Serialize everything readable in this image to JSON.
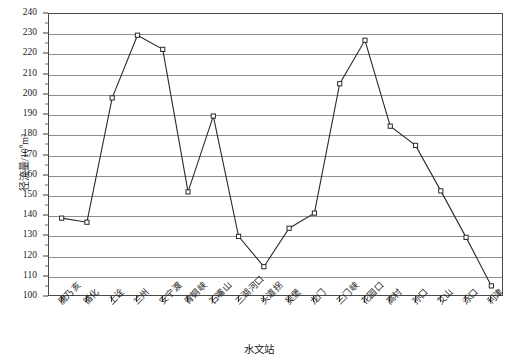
{
  "chart_data": {
    "type": "line",
    "title": "",
    "xlabel": "水文站",
    "ylabel": "径流量/10⁸m³",
    "ylabel_base": "径流量/10",
    "ylabel_sup": "8",
    "ylabel_tail": "m³",
    "ylim": [
      100,
      240
    ],
    "ytick_step": 10,
    "grid": true,
    "legend": "none",
    "categories": [
      "唐乃亥",
      "循化",
      "上诠",
      "兰州",
      "安宁渡",
      "青铜峡",
      "石嘴山",
      "三湖河口",
      "头道拐",
      "吴堡",
      "龙门",
      "三门峡",
      "花园口",
      "高村",
      "孙口",
      "艾山",
      "泺口",
      "利津"
    ],
    "yticks": [
      100,
      110,
      120,
      130,
      140,
      150,
      160,
      170,
      180,
      190,
      200,
      210,
      220,
      230,
      240
    ],
    "values": [
      139,
      137,
      198.5,
      229.5,
      222.5,
      152,
      189.5,
      130,
      115,
      134,
      141.5,
      205.5,
      227,
      184.5,
      175,
      152.5,
      129.5,
      105.5
    ],
    "series": [
      {
        "name": "径流量",
        "values": [
          139,
          137,
          198.5,
          229.5,
          222.5,
          152,
          189.5,
          130,
          115,
          134,
          141.5,
          205.5,
          227,
          184.5,
          175,
          152.5,
          129.5,
          105.5
        ],
        "color": "#2a2a2a",
        "marker": "open-square"
      }
    ],
    "colors": {
      "line": "#2a2a2a",
      "grid": "#8e8e8e",
      "frame": "#4a4a4a",
      "marker_fill": "#ffffff",
      "background": "#ffffff"
    }
  }
}
